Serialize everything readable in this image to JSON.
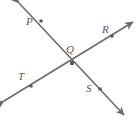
{
  "figure": {
    "background_color": "#ffffff",
    "stroke_color": "#6b6b6e",
    "label_color": "#58585a",
    "dot_color": "#58585a",
    "stroke_width": 1.6,
    "dot_size": 3.2,
    "labels": {
      "p": "P",
      "q": "Q",
      "r": "R",
      "t": "T",
      "s": "S"
    },
    "points": [
      {
        "name": "P",
        "x": 41,
        "y": 21
      },
      {
        "name": "Q",
        "x": 72,
        "y": 63
      },
      {
        "name": "R",
        "x": 112,
        "y": 36
      },
      {
        "name": "T",
        "x": 31,
        "y": 86
      },
      {
        "name": "S",
        "x": 100,
        "y": 89
      }
    ],
    "label_positions": [
      {
        "name": "P",
        "x": 26,
        "y": 16
      },
      {
        "name": "Q",
        "x": 66,
        "y": 44
      },
      {
        "name": "R",
        "x": 102,
        "y": 24
      },
      {
        "name": "T",
        "x": 18,
        "y": 71
      },
      {
        "name": "S",
        "x": 86,
        "y": 83
      }
    ],
    "lines": [
      {
        "name": "line-PQS",
        "through": [
          "P",
          "Q",
          "S"
        ],
        "start": {
          "x": 19,
          "y": 3
        },
        "end": {
          "x": 124,
          "y": 115
        },
        "arrow_start": true,
        "arrow_end": true
      },
      {
        "name": "line-TQR",
        "through": [
          "T",
          "Q",
          "R"
        ],
        "start": {
          "x": 4,
          "y": 101
        },
        "end": {
          "x": 133,
          "y": 22
        },
        "arrow_start": true,
        "arrow_end": true
      }
    ]
  }
}
